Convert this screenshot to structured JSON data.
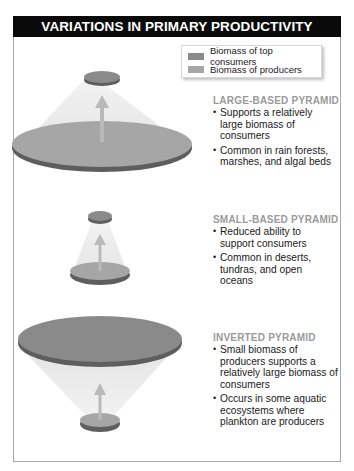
{
  "title": "VARIATIONS IN PRIMARY PRODUCTIVITY",
  "colors": {
    "header_bg": "#0a0a0a",
    "top_consumers": "#8a8a8a",
    "producers": "#a6a6a6",
    "disk_edge": "#5e5e5e",
    "section_title": "#9a9a9a",
    "arrow": "#b9b9b9"
  },
  "legend": {
    "items": [
      {
        "label": "Biomass of top consumers",
        "color": "#8a8a8a"
      },
      {
        "label": "Biomass of producers",
        "color": "#a6a6a6"
      }
    ]
  },
  "sections": [
    {
      "title": "LARGE-BASED PYRAMID",
      "bullets": [
        "Supports a relatively large biomass of consumers",
        "Common in rain forests, marshes, and algal beds"
      ]
    },
    {
      "title": "SMALL-BASED PYRAMID",
      "bullets": [
        "Reduced ability to support consumers",
        "Common in deserts, tundras, and open oceans"
      ]
    },
    {
      "title": "INVERTED PYRAMID",
      "bullets": [
        "Small biomass of producers supports a relatively large biomass of consumers",
        "Occurs in some aquatic ecosystems where plankton are producers"
      ]
    }
  ],
  "bullet_char": "•"
}
